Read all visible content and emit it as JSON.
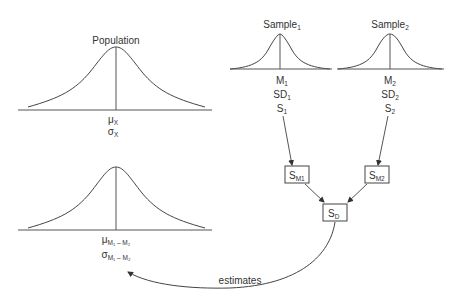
{
  "population": {
    "title": "Population",
    "mean_symbol": "μ",
    "mean_sub": "X",
    "sd_symbol": "σ",
    "sd_sub": "X"
  },
  "difference_distribution": {
    "mean_symbol": "μ",
    "mean_sub": "M₁ – M₂",
    "sd_symbol": "σ",
    "sd_sub": "M₁ – M₂"
  },
  "samples": [
    {
      "title": "Sample",
      "title_sub": "1",
      "stats": [
        {
          "base": "M",
          "sub": "1"
        },
        {
          "base": "SD",
          "sub": "1"
        },
        {
          "base": "S",
          "sub": "1"
        }
      ]
    },
    {
      "title": "Sample",
      "title_sub": "2",
      "stats": [
        {
          "base": "M",
          "sub": "2"
        },
        {
          "base": "SD",
          "sub": "2"
        },
        {
          "base": "S",
          "sub": "2"
        }
      ]
    }
  ],
  "boxes": {
    "sm1": {
      "base": "S",
      "sub": "M1"
    },
    "sm2": {
      "base": "S",
      "sub": "M2"
    },
    "sd": {
      "base": "S",
      "sub": "D"
    }
  },
  "arrow_label": "estimates"
}
